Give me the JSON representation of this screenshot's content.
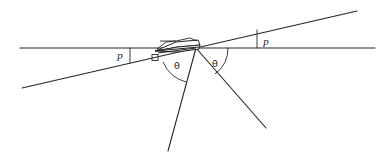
{
  "figure": {
    "type": "geometry-diagram",
    "background_color": "#ffffff",
    "stroke_color": "#262626",
    "width": 378,
    "height": 157
  },
  "labels": {
    "angle_p_left": "p",
    "angle_p_right": "p",
    "angle_theta_left": "θ",
    "angle_theta_right": "θ"
  },
  "geometry": {
    "horizontal_line": {
      "x1": 20,
      "y1": 48,
      "x2": 375,
      "y2": 48
    },
    "inclined_line": {
      "x1": 22,
      "y1": 88,
      "x2": 357,
      "y2": 11
    },
    "vertex": {
      "x": 196,
      "y": 48
    },
    "ray_left_down": {
      "x1": 196,
      "y1": 48,
      "x2": 168,
      "y2": 151
    },
    "ray_right_down": {
      "x1": 196,
      "y1": 48,
      "x2": 266,
      "y2": 128
    },
    "tick_left": {
      "x": 130,
      "y_top": 48,
      "y_bottom": 63
    },
    "tick_right": {
      "x": 257,
      "y_top": 30,
      "y_bottom": 48
    },
    "right_angle_marker": {
      "x": 153,
      "y": 55,
      "size": 6
    },
    "arc_theta_left": {
      "cx": 196,
      "cy": 48,
      "r": 35
    },
    "arc_theta_right": {
      "cx": 196,
      "cy": 48,
      "r": 32
    },
    "lens_element": {
      "comment": "thin elongated slab drawn edge-on at the intersection",
      "left_tip": {
        "x": 155,
        "y": 50
      },
      "right_tip": {
        "x": 200,
        "y": 44
      }
    }
  },
  "label_positions": {
    "angle_p_left": {
      "x": 120,
      "y": 56
    },
    "angle_p_right": {
      "x": 266,
      "y": 42
    },
    "angle_theta_left": {
      "x": 177,
      "y": 66
    },
    "angle_theta_right": {
      "x": 215,
      "y": 64
    }
  }
}
